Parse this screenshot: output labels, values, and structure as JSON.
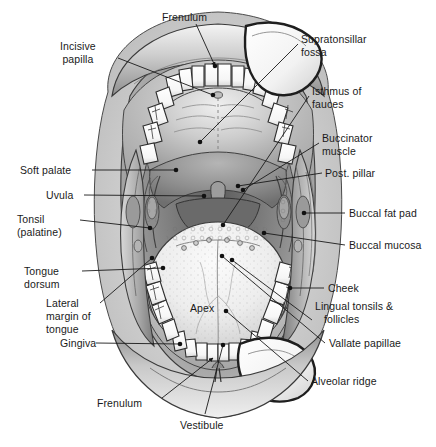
{
  "figure": {
    "background_color": "#ffffff",
    "width": 436,
    "height": 447,
    "line_color": "#1a1a1a",
    "text_color": "#1a1a1a"
  },
  "inline_labels": [
    {
      "id": "apex",
      "text": "Apex",
      "x": 190,
      "y": 302
    }
  ],
  "labels_top": [
    {
      "id": "frenulum-upper",
      "text": "Frenulum",
      "x": 162,
      "y": 11,
      "align": "c"
    }
  ],
  "labels_left": [
    {
      "id": "incisive-papilla",
      "text": "Incisive\npapilla",
      "x": 60,
      "y": 40,
      "align": "c"
    },
    {
      "id": "soft-palate",
      "text": "Soft palate",
      "x": 20,
      "y": 164,
      "align": "l"
    },
    {
      "id": "uvula",
      "text": "Uvula",
      "x": 46,
      "y": 189,
      "align": "l"
    },
    {
      "id": "tonsil-palatine",
      "text": "Tonsil\n(palatine)",
      "x": 17,
      "y": 213,
      "align": "l"
    },
    {
      "id": "tongue-dorsum",
      "text": "Tongue\ndorsum",
      "x": 24,
      "y": 265,
      "align": "l"
    },
    {
      "id": "lateral-margin-of-tongue",
      "text": "Lateral\nmargin of\ntongue",
      "x": 46,
      "y": 297,
      "align": "l"
    },
    {
      "id": "gingiva",
      "text": "Gingiva",
      "x": 60,
      "y": 337,
      "align": "l"
    }
  ],
  "labels_right": [
    {
      "id": "supratonsillar-fossa",
      "text": "Supratonsillar\nfossa",
      "x": 301,
      "y": 33,
      "align": "l"
    },
    {
      "id": "isthmus-of-fauces",
      "text": "Isthmus of\nfauces",
      "x": 312,
      "y": 85,
      "align": "l"
    },
    {
      "id": "buccinator-muscle",
      "text": "Buccinator\nmuscle",
      "x": 322,
      "y": 132,
      "align": "l"
    },
    {
      "id": "post-pillar",
      "text": "Post. pillar",
      "x": 325,
      "y": 167,
      "align": "l"
    },
    {
      "id": "buccal-fat-pad",
      "text": "Buccal fat pad",
      "x": 349,
      "y": 207,
      "align": "l"
    },
    {
      "id": "buccal-mucosa",
      "text": "Buccal mucosa",
      "x": 349,
      "y": 239,
      "align": "l"
    },
    {
      "id": "cheek",
      "text": "Cheek",
      "x": 328,
      "y": 282,
      "align": "l"
    },
    {
      "id": "lingual-tonsils-follicles",
      "text": "Lingual tonsils &\n   follicles",
      "x": 315,
      "y": 300,
      "align": "l"
    },
    {
      "id": "vallate-papillae",
      "text": "Vallate papillae",
      "x": 329,
      "y": 337,
      "align": "l"
    },
    {
      "id": "alveolar-ridge",
      "text": "Alveolar ridge",
      "x": 311,
      "y": 375,
      "align": "l"
    }
  ],
  "labels_bottom": [
    {
      "id": "frenulum-lower",
      "text": "Frenulum",
      "x": 97,
      "y": 397,
      "align": "l"
    },
    {
      "id": "vestibule",
      "text": "Vestibule",
      "x": 180,
      "y": 419,
      "align": "l"
    }
  ],
  "leader_lines": [
    {
      "id": "leader-frenulum-upper",
      "kind": "arrow",
      "from": [
        196,
        24
      ],
      "to": [
        215,
        66
      ]
    },
    {
      "id": "leader-incisive-papilla",
      "kind": "line",
      "from": [
        118,
        58
      ],
      "to": [
        213,
        95
      ]
    },
    {
      "id": "leader-soft-palate",
      "kind": "line",
      "from": [
        92,
        170
      ],
      "to": [
        176,
        170
      ]
    },
    {
      "id": "leader-uvula",
      "kind": "line",
      "from": [
        84,
        195
      ],
      "to": [
        204,
        196
      ]
    },
    {
      "id": "leader-tonsil",
      "kind": "line",
      "from": [
        80,
        220
      ],
      "to": [
        150,
        228
      ]
    },
    {
      "id": "leader-tongue-dorsum",
      "kind": "line",
      "from": [
        82,
        271
      ],
      "to": [
        163,
        268
      ]
    },
    {
      "id": "leader-lateral-margin",
      "kind": "line",
      "from": [
        100,
        303
      ],
      "to": [
        152,
        258
      ]
    },
    {
      "id": "leader-gingiva",
      "kind": "line",
      "from": [
        96,
        343
      ],
      "to": [
        180,
        344
      ]
    },
    {
      "id": "leader-supratonsillar",
      "kind": "line",
      "from": [
        298,
        44
      ],
      "to": [
        200,
        142
      ]
    },
    {
      "id": "leader-isthmus",
      "kind": "line",
      "from": [
        309,
        96
      ],
      "to": [
        223,
        225
      ]
    },
    {
      "id": "leader-buccinator",
      "kind": "line",
      "from": [
        319,
        143
      ],
      "to": [
        243,
        190
      ]
    },
    {
      "id": "leader-post-pillar",
      "kind": "line",
      "from": [
        322,
        173
      ],
      "to": [
        238,
        186
      ]
    },
    {
      "id": "leader-buccal-fat-pad",
      "kind": "line",
      "from": [
        345,
        213
      ],
      "to": [
        304,
        213
      ]
    },
    {
      "id": "leader-buccal-mucosa",
      "kind": "line",
      "from": [
        345,
        245
      ],
      "to": [
        264,
        233
      ]
    },
    {
      "id": "leader-cheek",
      "kind": "line",
      "from": [
        324,
        288
      ],
      "to": [
        290,
        288
      ]
    },
    {
      "id": "leader-lingual-tonsils",
      "kind": "line",
      "from": [
        312,
        320
      ],
      "to": [
        232,
        260
      ]
    },
    {
      "id": "leader-vallate-papillae",
      "kind": "line",
      "from": [
        325,
        343
      ],
      "to": [
        222,
        256
      ]
    },
    {
      "id": "leader-alveolar-ridge",
      "kind": "line",
      "from": [
        308,
        381
      ],
      "to": [
        226,
        311
      ]
    },
    {
      "id": "leader-frenulum-lower",
      "kind": "arrow",
      "from": [
        162,
        398
      ],
      "to": [
        213,
        358
      ]
    },
    {
      "id": "leader-vestibule",
      "kind": "line",
      "from": [
        205,
        414
      ],
      "to": [
        223,
        345
      ]
    }
  ],
  "leader_dots": [
    {
      "id": "dot-frenulum-upper",
      "x": 215,
      "y": 66
    },
    {
      "id": "dot-incisive-papilla",
      "x": 213,
      "y": 95
    },
    {
      "id": "dot-soft-palate",
      "x": 176,
      "y": 170
    },
    {
      "id": "dot-uvula",
      "x": 204,
      "y": 196
    },
    {
      "id": "dot-tonsil",
      "x": 150,
      "y": 228
    },
    {
      "id": "dot-tongue-dorsum",
      "x": 163,
      "y": 268
    },
    {
      "id": "dot-lateral-margin",
      "x": 152,
      "y": 258
    },
    {
      "id": "dot-gingiva",
      "x": 180,
      "y": 344
    },
    {
      "id": "dot-supratonsillar",
      "x": 200,
      "y": 142
    },
    {
      "id": "dot-isthmus",
      "x": 223,
      "y": 225
    },
    {
      "id": "dot-buccinator",
      "x": 243,
      "y": 190
    },
    {
      "id": "dot-post-pillar",
      "x": 238,
      "y": 186
    },
    {
      "id": "dot-buccal-fat-pad",
      "x": 304,
      "y": 213
    },
    {
      "id": "dot-buccal-mucosa",
      "x": 264,
      "y": 233
    },
    {
      "id": "dot-cheek",
      "x": 290,
      "y": 288
    },
    {
      "id": "dot-lingual-tonsils",
      "x": 232,
      "y": 260
    },
    {
      "id": "dot-vallate-papillae",
      "x": 222,
      "y": 256
    },
    {
      "id": "dot-alveolar-ridge",
      "x": 226,
      "y": 311
    },
    {
      "id": "dot-vestibule",
      "x": 223,
      "y": 345
    }
  ],
  "anatomy_regions": [
    {
      "id": "upper-lip",
      "name": "upper lip"
    },
    {
      "id": "hard-palate",
      "name": "hard palate"
    },
    {
      "id": "soft-palate-region",
      "name": "soft palate"
    },
    {
      "id": "uvula-region",
      "name": "uvula"
    },
    {
      "id": "tongue",
      "name": "tongue dorsum"
    },
    {
      "id": "upper-dental-arch",
      "name": "maxillary teeth"
    },
    {
      "id": "lower-dental-arch",
      "name": "mandibular teeth"
    },
    {
      "id": "lower-lip",
      "name": "lower lip"
    },
    {
      "id": "cheek-retractor",
      "name": "cheek retractor"
    }
  ]
}
